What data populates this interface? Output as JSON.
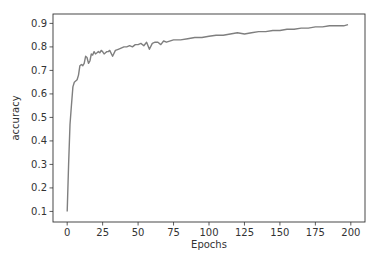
{
  "chart_data": {
    "type": "line",
    "title": "",
    "xlabel": "Epochs",
    "ylabel": "accuracy",
    "xlim": [
      -10,
      210
    ],
    "ylim": [
      0.055,
      0.94
    ],
    "grid": false,
    "legend": null,
    "xticks": [
      0,
      25,
      50,
      75,
      100,
      125,
      150,
      175,
      200
    ],
    "yticks": [
      0.1,
      0.2,
      0.3,
      0.4,
      0.5,
      0.6,
      0.7,
      0.8,
      0.9
    ],
    "xtick_labels": [
      "0",
      "25",
      "50",
      "75",
      "100",
      "125",
      "150",
      "175",
      "200"
    ],
    "ytick_labels": [
      "0.1",
      "0.2",
      "0.3",
      "0.4",
      "0.5",
      "0.6",
      "0.7",
      "0.8",
      "0.9"
    ],
    "series": [
      {
        "name": "accuracy",
        "color": "#7f7f7f",
        "x": [
          0,
          1,
          2,
          3,
          4,
          5,
          6,
          7,
          8,
          9,
          10,
          11,
          12,
          13,
          14,
          15,
          16,
          17,
          18,
          19,
          20,
          21,
          22,
          23,
          24,
          25,
          26,
          27,
          28,
          29,
          30,
          32,
          34,
          36,
          38,
          40,
          42,
          44,
          46,
          48,
          50,
          52,
          54,
          56,
          58,
          60,
          62,
          64,
          66,
          68,
          70,
          75,
          80,
          85,
          90,
          95,
          100,
          105,
          110,
          115,
          120,
          125,
          130,
          135,
          140,
          145,
          150,
          155,
          160,
          165,
          170,
          175,
          180,
          185,
          190,
          195,
          198
        ],
        "values": [
          0.1,
          0.3,
          0.47,
          0.55,
          0.63,
          0.65,
          0.655,
          0.66,
          0.68,
          0.72,
          0.725,
          0.72,
          0.73,
          0.76,
          0.755,
          0.73,
          0.74,
          0.77,
          0.765,
          0.78,
          0.77,
          0.775,
          0.78,
          0.775,
          0.785,
          0.78,
          0.77,
          0.775,
          0.78,
          0.78,
          0.785,
          0.76,
          0.785,
          0.79,
          0.795,
          0.8,
          0.8,
          0.805,
          0.8,
          0.81,
          0.81,
          0.815,
          0.805,
          0.82,
          0.79,
          0.815,
          0.82,
          0.82,
          0.81,
          0.825,
          0.82,
          0.83,
          0.83,
          0.835,
          0.84,
          0.84,
          0.845,
          0.85,
          0.85,
          0.855,
          0.86,
          0.855,
          0.86,
          0.865,
          0.865,
          0.87,
          0.87,
          0.875,
          0.875,
          0.88,
          0.88,
          0.885,
          0.885,
          0.89,
          0.89,
          0.89,
          0.895
        ]
      }
    ]
  }
}
